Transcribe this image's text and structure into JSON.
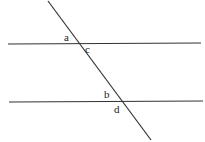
{
  "diagram": {
    "type": "parallel-lines-transversal",
    "lines": {
      "top": {
        "x1": 8,
        "y1": 44,
        "x2": 201,
        "y2": 43
      },
      "bottom": {
        "x1": 9,
        "y1": 102,
        "x2": 203,
        "y2": 101
      },
      "transversal": {
        "x1": 48,
        "y1": 1,
        "x2": 151,
        "y2": 140
      }
    },
    "labels": {
      "a": "a",
      "b": "b",
      "c": "c",
      "d": "d"
    },
    "stroke_color": "#333333"
  }
}
